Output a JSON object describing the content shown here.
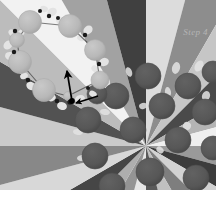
{
  "figure": {
    "title_label": "Step 4",
    "background_color": "#ffffff",
    "palette": {
      "ring_bead": "#b9b9b9",
      "ring_bead_edge": "#ababab",
      "halo_blob": "#e3e3e3",
      "linker_dot": "#1a1a1a",
      "cluster_particle": "#575757",
      "cluster_particle_edge": "#4e4e4e",
      "wedge_dark": "#3c3c3c",
      "wedge_mid": "#8d8d8d",
      "wedge_light": "#dcdcdc",
      "arrow": "#000000"
    },
    "ring": {
      "name": "detached-bead-ring",
      "bead_count": 8,
      "beads": [
        {
          "cx": 30,
          "cy": 22,
          "r": 11.5
        },
        {
          "cx": 70,
          "cy": 26,
          "r": 11.5
        },
        {
          "cx": 95,
          "cy": 50,
          "r": 10.5
        },
        {
          "cx": 100,
          "cy": 80,
          "r": 9.0
        },
        {
          "cx": 68,
          "cy": 96,
          "r": 4.5
        },
        {
          "cx": 44,
          "cy": 90,
          "r": 11.5
        },
        {
          "cx": 20,
          "cy": 62,
          "r": 11.5
        },
        {
          "cx": 17,
          "cy": 40,
          "r": 7.5
        }
      ],
      "linkers": [
        {
          "cx": 49,
          "cy": 16,
          "r": 2.2
        },
        {
          "cx": 58,
          "cy": 18,
          "r": 2.0
        },
        {
          "cx": 85,
          "cy": 35,
          "r": 2.2
        },
        {
          "cx": 99,
          "cy": 64,
          "r": 2.2
        },
        {
          "cx": 88,
          "cy": 88,
          "r": 2.0
        },
        {
          "cx": 70,
          "cy": 102,
          "r": 2.6
        },
        {
          "cx": 57,
          "cy": 101,
          "r": 2.2
        },
        {
          "cx": 28,
          "cy": 80,
          "r": 2.2
        },
        {
          "cx": 14,
          "cy": 52,
          "r": 2.2
        },
        {
          "cx": 15,
          "cy": 31,
          "r": 2.2
        },
        {
          "cx": 40,
          "cy": 11,
          "r": 2.0
        }
      ],
      "halos": [
        {
          "cx": 52,
          "cy": 12,
          "rx": 5,
          "ry": 4,
          "rot": -30
        },
        {
          "cx": 61,
          "cy": 21,
          "rx": 5,
          "ry": 4,
          "rot": 20
        },
        {
          "cx": 88,
          "cy": 30,
          "rx": 5,
          "ry": 4,
          "rot": -40
        },
        {
          "cx": 81,
          "cy": 38,
          "rx": 4,
          "ry": 3,
          "rot": 25
        },
        {
          "cx": 104,
          "cy": 62,
          "rx": 5,
          "ry": 4,
          "rot": -20
        },
        {
          "cx": 95,
          "cy": 69,
          "rx": 4,
          "ry": 3,
          "rot": 40
        },
        {
          "cx": 105,
          "cy": 82,
          "rx": 5,
          "ry": 4,
          "rot": -10
        },
        {
          "cx": 93,
          "cy": 94,
          "rx": 4,
          "ry": 3,
          "rot": 30
        },
        {
          "cx": 80,
          "cy": 99,
          "rx": 5,
          "ry": 4,
          "rot": -15
        },
        {
          "cx": 62,
          "cy": 106,
          "rx": 5,
          "ry": 4,
          "rot": 15
        },
        {
          "cx": 52,
          "cy": 98,
          "rx": 4,
          "ry": 3,
          "rot": -35
        },
        {
          "cx": 31,
          "cy": 86,
          "rx": 5,
          "ry": 4,
          "rot": 35
        },
        {
          "cx": 24,
          "cy": 76,
          "rx": 4,
          "ry": 3,
          "rot": -25
        },
        {
          "cx": 10,
          "cy": 56,
          "rx": 5,
          "ry": 4,
          "rot": 10
        },
        {
          "cx": 8,
          "cy": 45,
          "rx": 5,
          "ry": 4,
          "rot": -45
        },
        {
          "cx": 12,
          "cy": 33,
          "rx": 4,
          "ry": 3,
          "rot": 50
        },
        {
          "cx": 21,
          "cy": 33,
          "rx": 4,
          "ry": 3,
          "rot": -50
        },
        {
          "cx": 44,
          "cy": 9,
          "rx": 4,
          "ry": 3,
          "rot": 15
        }
      ]
    },
    "arrows": [
      {
        "name": "long-motion-arrow",
        "x1": 72,
        "y1": 101,
        "x2": 67,
        "y2": 71
      },
      {
        "name": "short-release-arrow",
        "x1": 98,
        "y1": 96,
        "x2": 76,
        "y2": 103
      }
    ],
    "cluster": {
      "name": "radial-particle-cluster",
      "center_x": 146,
      "center_y": 146,
      "wedge_count": 24,
      "wedge_shades": [
        "#dcdcdc",
        "#8d8d8d",
        "#c6c6c6",
        "#4a4a4a",
        "#b4b4b4",
        "#efefef",
        "#9a9a9a",
        "#3c3c3c",
        "#d2d2d2",
        "#7e7e7e",
        "#c0c0c0",
        "#5a5a5a",
        "#e6e6e6",
        "#949494",
        "#aeaeae",
        "#464646",
        "#d8d8d8",
        "#888888",
        "#cacaca",
        "#525252",
        "#bcbcbc",
        "#f2f2f2",
        "#a2a2a2",
        "#404040"
      ],
      "particles": [
        {
          "cx": 148,
          "cy": 76,
          "r": 13
        },
        {
          "cx": 188,
          "cy": 86,
          "r": 13
        },
        {
          "cx": 213,
          "cy": 72,
          "r": 11
        },
        {
          "cx": 116,
          "cy": 96,
          "r": 13
        },
        {
          "cx": 162,
          "cy": 106,
          "r": 13
        },
        {
          "cx": 205,
          "cy": 112,
          "r": 13
        },
        {
          "cx": 88,
          "cy": 120,
          "r": 13
        },
        {
          "cx": 133,
          "cy": 130,
          "r": 13
        },
        {
          "cx": 178,
          "cy": 140,
          "r": 13
        },
        {
          "cx": 213,
          "cy": 148,
          "r": 12
        },
        {
          "cx": 95,
          "cy": 156,
          "r": 13
        },
        {
          "cx": 150,
          "cy": 172,
          "r": 14
        },
        {
          "cx": 196,
          "cy": 178,
          "r": 13
        },
        {
          "cx": 112,
          "cy": 186,
          "r": 13
        },
        {
          "cx": 97,
          "cy": 94,
          "r": 10
        }
      ],
      "speckles": [
        {
          "cx": 176,
          "cy": 68,
          "rx": 4,
          "ry": 6,
          "rot": 15
        },
        {
          "cx": 129,
          "cy": 72,
          "rx": 3,
          "ry": 5,
          "rot": -20
        },
        {
          "cx": 199,
          "cy": 66,
          "rx": 4,
          "ry": 6,
          "rot": 30
        },
        {
          "cx": 168,
          "cy": 92,
          "rx": 3,
          "ry": 5,
          "rot": -10
        },
        {
          "cx": 206,
          "cy": 96,
          "rx": 4,
          "ry": 5,
          "rot": 20
        },
        {
          "cx": 105,
          "cy": 112,
          "rx": 5,
          "ry": 3,
          "rot": 10
        },
        {
          "cx": 143,
          "cy": 106,
          "rx": 4,
          "ry": 3,
          "rot": -15
        },
        {
          "cx": 78,
          "cy": 132,
          "rx": 5,
          "ry": 3,
          "rot": 5
        },
        {
          "cx": 187,
          "cy": 126,
          "rx": 4,
          "ry": 4,
          "rot": 25
        },
        {
          "cx": 82,
          "cy": 158,
          "rx": 5,
          "ry": 3,
          "rot": -5
        },
        {
          "cx": 160,
          "cy": 150,
          "rx": 4,
          "ry": 3,
          "rot": 40
        }
      ]
    }
  }
}
